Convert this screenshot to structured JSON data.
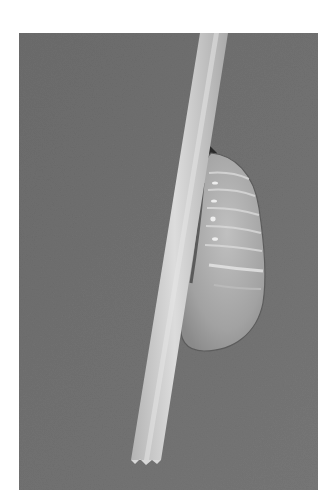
{
  "image": {
    "alt": "Grayscale photograph of a pupa (chrysalis) hanging from a thin diagonal stick against a gray background",
    "subject": "chrysalis",
    "colors": {
      "background": "#727272",
      "background_dark": "#656565",
      "stick": "#c8c8c8",
      "stick_highlight": "#dedede",
      "chrysalis_body": "#a8a8a8",
      "chrysalis_light": "#c4c4c4",
      "chrysalis_shadow": "#2a2a2a",
      "page": "#ffffff"
    }
  }
}
